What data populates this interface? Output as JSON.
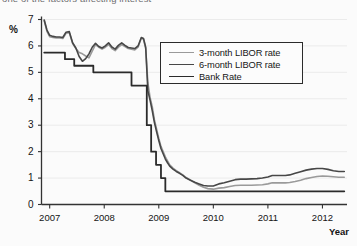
{
  "caption": {
    "clipped_top_text": "one of the factors affecting interest"
  },
  "axes": {
    "y_unit_label": "%",
    "x_title": "Year",
    "y_ticks": [
      "0",
      "1",
      "2",
      "3",
      "4",
      "5",
      "6",
      "7"
    ],
    "x_ticks": [
      "2007",
      "2008",
      "2009",
      "2010",
      "2011",
      "2012"
    ]
  },
  "legend": {
    "position": "inside-top-right",
    "items": [
      {
        "label": "3-month LIBOR rate",
        "color": "#9a9a9a",
        "width": 1.6
      },
      {
        "label": "6-month LIBOR rate",
        "color": "#474747",
        "width": 1.8
      },
      {
        "label": "Bank Rate",
        "color": "#2b2b2b",
        "width": 1.8
      }
    ]
  },
  "chart_data": {
    "type": "line",
    "title": "",
    "xlabel": "Year",
    "ylabel": "%",
    "ylim": [
      0,
      7
    ],
    "xlim": [
      2006.85,
      2012.45
    ],
    "grid": true,
    "legend_position": "inside-top-right",
    "series": [
      {
        "name": "3-month LIBOR rate",
        "color": "#9a9a9a",
        "points": [
          [
            2006.9,
            6.95
          ],
          [
            2006.95,
            6.55
          ],
          [
            2007.0,
            6.35
          ],
          [
            2007.06,
            6.32
          ],
          [
            2007.12,
            6.3
          ],
          [
            2007.18,
            6.3
          ],
          [
            2007.24,
            6.28
          ],
          [
            2007.3,
            6.48
          ],
          [
            2007.36,
            6.5
          ],
          [
            2007.42,
            6.1
          ],
          [
            2007.48,
            5.9
          ],
          [
            2007.54,
            5.75
          ],
          [
            2007.6,
            5.7
          ],
          [
            2007.66,
            5.62
          ],
          [
            2007.72,
            5.55
          ],
          [
            2007.78,
            5.8
          ],
          [
            2007.84,
            6.05
          ],
          [
            2007.9,
            5.95
          ],
          [
            2007.96,
            5.88
          ],
          [
            2008.02,
            5.95
          ],
          [
            2008.08,
            6.05
          ],
          [
            2008.14,
            5.9
          ],
          [
            2008.2,
            5.82
          ],
          [
            2008.26,
            5.95
          ],
          [
            2008.32,
            6.05
          ],
          [
            2008.38,
            5.98
          ],
          [
            2008.44,
            5.9
          ],
          [
            2008.5,
            5.88
          ],
          [
            2008.56,
            5.85
          ],
          [
            2008.62,
            5.95
          ],
          [
            2008.68,
            6.3
          ],
          [
            2008.72,
            6.25
          ],
          [
            2008.76,
            5.9
          ],
          [
            2008.8,
            4.6
          ],
          [
            2008.84,
            4.05
          ],
          [
            2008.88,
            3.7
          ],
          [
            2008.92,
            3.2
          ],
          [
            2008.96,
            2.85
          ],
          [
            2009.0,
            2.5
          ],
          [
            2009.04,
            2.2
          ],
          [
            2009.08,
            2.0
          ],
          [
            2009.12,
            1.8
          ],
          [
            2009.16,
            1.65
          ],
          [
            2009.2,
            1.5
          ],
          [
            2009.26,
            1.38
          ],
          [
            2009.32,
            1.28
          ],
          [
            2009.38,
            1.2
          ],
          [
            2009.44,
            1.12
          ],
          [
            2009.5,
            1.02
          ],
          [
            2009.58,
            0.92
          ],
          [
            2009.66,
            0.82
          ],
          [
            2009.74,
            0.73
          ],
          [
            2009.82,
            0.65
          ],
          [
            2009.9,
            0.6
          ],
          [
            2010.0,
            0.58
          ],
          [
            2010.1,
            0.62
          ],
          [
            2010.2,
            0.64
          ],
          [
            2010.3,
            0.68
          ],
          [
            2010.4,
            0.72
          ],
          [
            2010.5,
            0.73
          ],
          [
            2010.6,
            0.73
          ],
          [
            2010.7,
            0.73
          ],
          [
            2010.8,
            0.74
          ],
          [
            2010.9,
            0.75
          ],
          [
            2011.0,
            0.78
          ],
          [
            2011.08,
            0.82
          ],
          [
            2011.16,
            0.82
          ],
          [
            2011.24,
            0.82
          ],
          [
            2011.32,
            0.82
          ],
          [
            2011.4,
            0.83
          ],
          [
            2011.5,
            0.87
          ],
          [
            2011.6,
            0.92
          ],
          [
            2011.7,
            0.98
          ],
          [
            2011.8,
            1.02
          ],
          [
            2011.9,
            1.06
          ],
          [
            2012.0,
            1.08
          ],
          [
            2012.1,
            1.07
          ],
          [
            2012.2,
            1.05
          ],
          [
            2012.3,
            1.03
          ],
          [
            2012.4,
            1.03
          ]
        ]
      },
      {
        "name": "6-month LIBOR rate",
        "color": "#474747",
        "points": [
          [
            2006.9,
            6.98
          ],
          [
            2006.95,
            6.6
          ],
          [
            2007.0,
            6.4
          ],
          [
            2007.06,
            6.36
          ],
          [
            2007.12,
            6.34
          ],
          [
            2007.18,
            6.34
          ],
          [
            2007.24,
            6.32
          ],
          [
            2007.3,
            6.52
          ],
          [
            2007.36,
            6.54
          ],
          [
            2007.42,
            6.12
          ],
          [
            2007.48,
            5.92
          ],
          [
            2007.54,
            5.6
          ],
          [
            2007.6,
            5.42
          ],
          [
            2007.66,
            5.52
          ],
          [
            2007.72,
            5.7
          ],
          [
            2007.78,
            5.95
          ],
          [
            2007.84,
            6.1
          ],
          [
            2007.9,
            5.98
          ],
          [
            2007.96,
            5.92
          ],
          [
            2008.02,
            6.0
          ],
          [
            2008.08,
            6.12
          ],
          [
            2008.14,
            5.96
          ],
          [
            2008.2,
            5.88
          ],
          [
            2008.26,
            6.02
          ],
          [
            2008.32,
            6.12
          ],
          [
            2008.38,
            6.02
          ],
          [
            2008.44,
            5.94
          ],
          [
            2008.5,
            5.92
          ],
          [
            2008.56,
            5.9
          ],
          [
            2008.62,
            6.0
          ],
          [
            2008.68,
            6.32
          ],
          [
            2008.72,
            6.28
          ],
          [
            2008.76,
            5.95
          ],
          [
            2008.8,
            4.3
          ],
          [
            2008.84,
            3.95
          ],
          [
            2008.88,
            3.55
          ],
          [
            2008.92,
            3.1
          ],
          [
            2008.96,
            2.75
          ],
          [
            2009.0,
            2.42
          ],
          [
            2009.04,
            2.12
          ],
          [
            2009.08,
            1.92
          ],
          [
            2009.12,
            1.72
          ],
          [
            2009.16,
            1.58
          ],
          [
            2009.2,
            1.45
          ],
          [
            2009.26,
            1.34
          ],
          [
            2009.32,
            1.25
          ],
          [
            2009.38,
            1.18
          ],
          [
            2009.44,
            1.1
          ],
          [
            2009.5,
            1.0
          ],
          [
            2009.58,
            0.92
          ],
          [
            2009.66,
            0.84
          ],
          [
            2009.74,
            0.78
          ],
          [
            2009.82,
            0.72
          ],
          [
            2009.9,
            0.7
          ],
          [
            2010.0,
            0.7
          ],
          [
            2010.1,
            0.78
          ],
          [
            2010.2,
            0.82
          ],
          [
            2010.3,
            0.88
          ],
          [
            2010.4,
            0.94
          ],
          [
            2010.5,
            0.96
          ],
          [
            2010.6,
            0.96
          ],
          [
            2010.7,
            0.97
          ],
          [
            2010.8,
            0.98
          ],
          [
            2010.9,
            1.0
          ],
          [
            2011.0,
            1.04
          ],
          [
            2011.08,
            1.1
          ],
          [
            2011.16,
            1.1
          ],
          [
            2011.24,
            1.1
          ],
          [
            2011.32,
            1.1
          ],
          [
            2011.4,
            1.12
          ],
          [
            2011.5,
            1.18
          ],
          [
            2011.6,
            1.24
          ],
          [
            2011.7,
            1.3
          ],
          [
            2011.8,
            1.34
          ],
          [
            2011.9,
            1.36
          ],
          [
            2012.0,
            1.36
          ],
          [
            2012.1,
            1.33
          ],
          [
            2012.2,
            1.28
          ],
          [
            2012.3,
            1.25
          ],
          [
            2012.4,
            1.25
          ]
        ]
      },
      {
        "name": "Bank Rate",
        "color": "#2b2b2b",
        "step": true,
        "points": [
          [
            2006.9,
            5.75
          ],
          [
            2007.28,
            5.75
          ],
          [
            2007.28,
            5.5
          ],
          [
            2007.45,
            5.5
          ],
          [
            2007.45,
            5.25
          ],
          [
            2007.8,
            5.25
          ],
          [
            2007.8,
            5.0
          ],
          [
            2008.5,
            5.0
          ],
          [
            2008.5,
            4.5
          ],
          [
            2008.78,
            4.5
          ],
          [
            2008.78,
            3.0
          ],
          [
            2008.86,
            3.0
          ],
          [
            2008.86,
            2.0
          ],
          [
            2008.95,
            2.0
          ],
          [
            2008.95,
            1.5
          ],
          [
            2009.04,
            1.5
          ],
          [
            2009.04,
            1.0
          ],
          [
            2009.12,
            1.0
          ],
          [
            2009.12,
            0.5
          ],
          [
            2012.4,
            0.5
          ]
        ]
      }
    ]
  }
}
